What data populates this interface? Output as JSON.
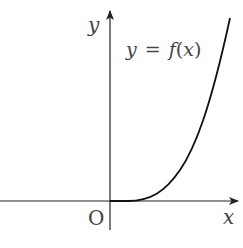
{
  "diagram": {
    "type": "function-graph",
    "axes": {
      "x_label": "x",
      "y_label": "y",
      "origin_label": "O"
    },
    "curve": {
      "label": "y = f(x)",
      "label_parts": {
        "lhs": "y",
        "eq": "=",
        "fn": "f",
        "open": "(",
        "arg": "x",
        "close": ")"
      },
      "description": "f(x) = 0 for x ≤ a (a > 0), increasing convex for x > a"
    },
    "colors": {
      "axis": "#222222",
      "curve": "#111111",
      "text": "#444444",
      "background": "#ffffff"
    }
  }
}
